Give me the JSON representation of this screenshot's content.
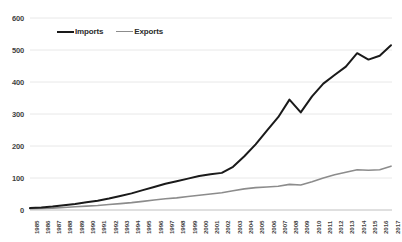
{
  "chart_data": {
    "type": "line",
    "title": "",
    "xlabel": "",
    "ylabel": "",
    "ylim": [
      0,
      600
    ],
    "yticks": [
      0,
      100,
      200,
      300,
      400,
      500,
      600
    ],
    "grid": true,
    "legend_position": "top-left",
    "categories": [
      "1985",
      "1986",
      "1987",
      "1988",
      "1989",
      "1990",
      "1991",
      "1992",
      "1993",
      "1994",
      "1995",
      "1996",
      "1997",
      "1998",
      "1999",
      "2000",
      "2001",
      "2002",
      "2003",
      "2004",
      "2005",
      "2006",
      "2007",
      "2008",
      "2009",
      "2010",
      "2011",
      "2012",
      "2013",
      "2014",
      "2015",
      "2016",
      "2017"
    ],
    "series": [
      {
        "name": "Imports",
        "color": "#1a1a1a",
        "values": [
          6,
          8,
          11,
          15,
          19,
          24,
          29,
          36,
          44,
          52,
          62,
          72,
          82,
          90,
          98,
          106,
          112,
          116,
          135,
          168,
          205,
          248,
          290,
          345,
          305,
          355,
          395,
          422,
          448,
          490,
          470,
          482,
          515
        ]
      },
      {
        "name": "Exports",
        "color": "#8c8c8c",
        "values": [
          4,
          5,
          6,
          8,
          10,
          12,
          14,
          17,
          20,
          23,
          27,
          31,
          35,
          38,
          42,
          46,
          50,
          54,
          60,
          66,
          70,
          72,
          74,
          80,
          78,
          88,
          100,
          110,
          118,
          126,
          124,
          126,
          137
        ]
      }
    ]
  },
  "legend": {
    "imports_label": "Imports",
    "exports_label": "Exports"
  }
}
